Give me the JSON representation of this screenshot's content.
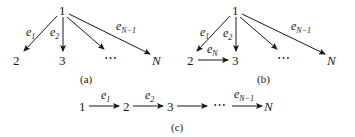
{
  "diagrams": {
    "a": {
      "caption": "(a)",
      "nodes": {
        "root": "1",
        "n2": "2",
        "n3": "3",
        "dots": "⋯",
        "nN": "N"
      },
      "edges": [
        {
          "from": "1",
          "to": "2",
          "label_base": "e",
          "label_sub": "1"
        },
        {
          "from": "1",
          "to": "3",
          "label_base": "e",
          "label_sub": "2"
        },
        {
          "from": "1",
          "to": "⋯",
          "label_base": "",
          "label_sub": ""
        },
        {
          "from": "1",
          "to": "N",
          "label_base": "e",
          "label_sub": "N−1"
        }
      ]
    },
    "b": {
      "caption": "(b)",
      "nodes": {
        "root": "1",
        "n2": "2",
        "n3": "3",
        "dots": "⋯",
        "nN": "N"
      },
      "edges": [
        {
          "from": "1",
          "to": "2",
          "label_base": "e",
          "label_sub": "1"
        },
        {
          "from": "1",
          "to": "3",
          "label_base": "e",
          "label_sub": "2"
        },
        {
          "from": "1",
          "to": "⋯",
          "label_base": "",
          "label_sub": ""
        },
        {
          "from": "1",
          "to": "N",
          "label_base": "e",
          "label_sub": "N−1"
        },
        {
          "from": "2",
          "to": "3",
          "label_base": "e",
          "label_sub": "N"
        }
      ]
    },
    "c": {
      "caption": "(c)",
      "nodes": {
        "n1": "1",
        "n2": "2",
        "n3": "3",
        "dots": "⋯",
        "nN": "N"
      },
      "edges": [
        {
          "from": "1",
          "to": "2",
          "label_base": "e",
          "label_sub": "1"
        },
        {
          "from": "2",
          "to": "3",
          "label_base": "e",
          "label_sub": "2"
        },
        {
          "from": "3",
          "to": "⋯",
          "label_base": "",
          "label_sub": ""
        },
        {
          "from": "⋯",
          "to": "N",
          "label_base": "e",
          "label_sub": "N−1"
        }
      ]
    }
  }
}
